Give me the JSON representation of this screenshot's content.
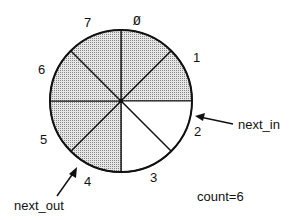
{
  "diagram": {
    "type": "circular-buffer",
    "slots": [
      {
        "index": 0,
        "label": "Ø",
        "filled": true
      },
      {
        "index": 1,
        "label": "1",
        "filled": true
      },
      {
        "index": 2,
        "label": "2",
        "filled": false
      },
      {
        "index": 3,
        "label": "3",
        "filled": false
      },
      {
        "index": 4,
        "label": "4",
        "filled": true
      },
      {
        "index": 5,
        "label": "5",
        "filled": true
      },
      {
        "index": 6,
        "label": "6",
        "filled": true
      },
      {
        "index": 7,
        "label": "7",
        "filled": true
      }
    ],
    "pointers": {
      "next_in": {
        "label": "next_in",
        "slot": 2
      },
      "next_out": {
        "label": "next_out",
        "slot": 4
      }
    },
    "count_label": "count=6",
    "colors": {
      "filled": "#c8c8c8",
      "empty": "#ffffff",
      "stroke": "#111111"
    }
  }
}
